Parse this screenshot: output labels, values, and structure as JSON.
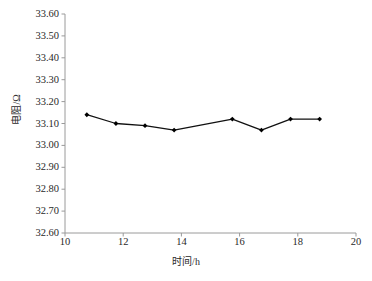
{
  "chart_data": {
    "type": "line",
    "title": "",
    "xlabel": "时间/h",
    "ylabel": "电阻/Ω",
    "xlim": [
      10,
      20
    ],
    "ylim": [
      32.6,
      33.6
    ],
    "grid": false,
    "legend": "none",
    "marker": "diamond",
    "line_color": "#111111",
    "marker_color": "#000000",
    "axis_color": "#9a9a9a",
    "background": "#ffffff",
    "xticks": [
      10,
      12,
      14,
      16,
      18,
      20
    ],
    "xtick_labels": [
      "10",
      "12",
      "14",
      "16",
      "18",
      "20"
    ],
    "yticks": [
      32.6,
      32.7,
      32.8,
      32.9,
      33.0,
      33.1,
      33.2,
      33.3,
      33.4,
      33.5,
      33.6
    ],
    "ytick_labels": [
      "32.60",
      "32.70",
      "32.80",
      "32.90",
      "33.00",
      "33.10",
      "33.20",
      "33.30",
      "33.40",
      "33.50",
      "33.60"
    ],
    "x": [
      10.75,
      11.75,
      12.75,
      13.75,
      15.75,
      16.75,
      17.75,
      18.75
    ],
    "values": [
      33.14,
      33.1,
      33.09,
      33.07,
      33.12,
      33.07,
      33.12,
      33.12
    ],
    "series": [
      {
        "name": "电阻",
        "x": [
          10.75,
          11.75,
          12.75,
          13.75,
          15.75,
          16.75,
          17.75,
          18.75
        ],
        "values": [
          33.14,
          33.1,
          33.09,
          33.07,
          33.12,
          33.07,
          33.12,
          33.12
        ]
      }
    ]
  },
  "caption": {
    "text": ""
  }
}
